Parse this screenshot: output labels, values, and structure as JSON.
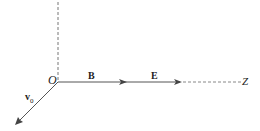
{
  "diagram": {
    "origin_label": "O",
    "axis_label": "Z",
    "vectors": [
      {
        "name": "B",
        "label": "B",
        "direction": "along Z axis"
      },
      {
        "name": "E",
        "label": "E",
        "direction": "along Z axis"
      },
      {
        "name": "v0",
        "label": "v",
        "subscript": "0",
        "direction": "down-left from origin"
      }
    ],
    "colors": {
      "line": "#555555",
      "text": "#222222"
    }
  }
}
